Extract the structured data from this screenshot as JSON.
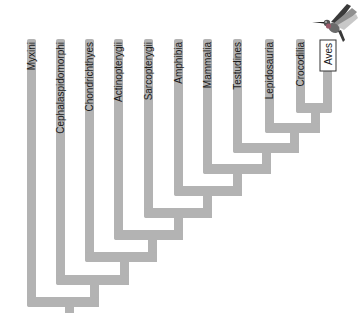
{
  "diagram": {
    "type": "cladogram",
    "branch_color": "#b3b3b3",
    "taxa": [
      {
        "name": "Myxini",
        "x": 27,
        "top": 39
      },
      {
        "name": "Cephalaspidomorphi",
        "x": 56,
        "top": 39
      },
      {
        "name": "Chondrichthyes",
        "x": 85,
        "top": 39
      },
      {
        "name": "Actinopterygii",
        "x": 114,
        "top": 39
      },
      {
        "name": "Sarcopterygii",
        "x": 144,
        "top": 39
      },
      {
        "name": "Amphibia",
        "x": 174,
        "top": 39
      },
      {
        "name": "Mammalia",
        "x": 203,
        "top": 39
      },
      {
        "name": "Testudines",
        "x": 233,
        "top": 39
      },
      {
        "name": "Lepidosauria",
        "x": 265,
        "top": 39
      },
      {
        "name": "Crocodilia",
        "x": 296,
        "top": 39
      },
      {
        "name": "Aves",
        "x": 318,
        "top": 39,
        "highlighted": true
      }
    ],
    "highlight_icon": "hummingbird-icon"
  }
}
